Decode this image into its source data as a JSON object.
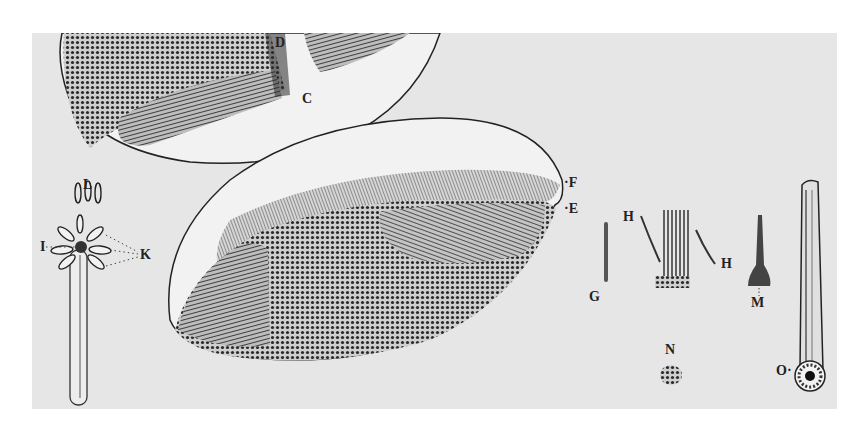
{
  "figure": {
    "background_color": "#e6e6e6",
    "ink_color": "#222222",
    "labels": [
      {
        "id": "D",
        "text": "D",
        "x": 275,
        "y": 36
      },
      {
        "id": "C",
        "text": "C",
        "x": 302,
        "y": 92
      },
      {
        "id": "F",
        "text": "·F",
        "x": 568,
        "y": 183
      },
      {
        "id": "E",
        "text": "·E",
        "x": 568,
        "y": 206
      },
      {
        "id": "L",
        "text": "L",
        "x": 83,
        "y": 178
      },
      {
        "id": "I",
        "text": "I",
        "x": 40,
        "y": 242
      },
      {
        "id": "K",
        "text": "K",
        "x": 140,
        "y": 248
      },
      {
        "id": "G",
        "text": "G",
        "x": 589,
        "y": 290
      },
      {
        "id": "H1",
        "text": "H",
        "x": 623,
        "y": 210
      },
      {
        "id": "H2",
        "text": "H",
        "x": 721,
        "y": 257
      },
      {
        "id": "M",
        "text": "M",
        "x": 751,
        "y": 296
      },
      {
        "id": "N",
        "text": "N",
        "x": 665,
        "y": 343
      },
      {
        "id": "O",
        "text": "O·",
        "x": 781,
        "y": 364
      }
    ]
  }
}
